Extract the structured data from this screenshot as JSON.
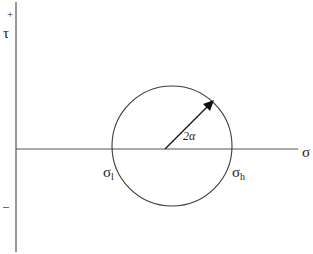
{
  "diagram": {
    "type": "mohr-circle",
    "axes": {
      "vertical_label": "τ",
      "vertical_plus": "+",
      "vertical_minus": "–",
      "horizontal_label": "σ"
    },
    "circle": {
      "low_label": "σ",
      "low_sub": "l",
      "high_label": "σ",
      "high_sub": "h",
      "radius_label": "2α"
    },
    "colors": {
      "line": "#3a3a3a",
      "text": "#222222"
    }
  }
}
